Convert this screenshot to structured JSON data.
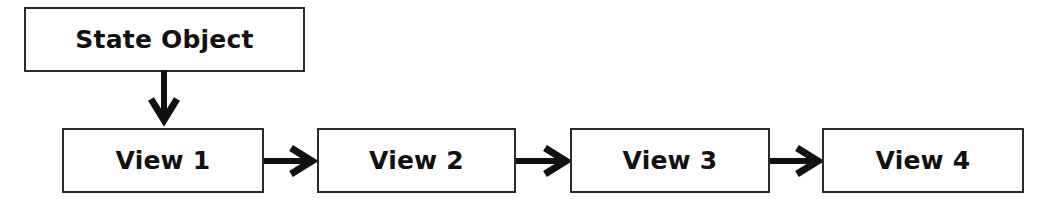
{
  "diagram": {
    "type": "flow-diagram",
    "background_color": "#ffffff",
    "stroke_color": "#2b2b2b",
    "text_color": "#111111",
    "source_node": {
      "id": "state-object",
      "label": "State Object"
    },
    "flow_nodes": [
      {
        "id": "view-1",
        "label": "View 1"
      },
      {
        "id": "view-2",
        "label": "View 2"
      },
      {
        "id": "view-3",
        "label": "View 3"
      },
      {
        "id": "view-4",
        "label": "View 4"
      }
    ],
    "connectors": [
      {
        "id": "arrow-state-object-to-view-1",
        "direction": "down",
        "from": "state-object",
        "to": "view-1"
      },
      {
        "id": "arrow-view-1-to-view-2",
        "direction": "right",
        "from": "view-1",
        "to": "view-2"
      },
      {
        "id": "arrow-view-2-to-view-3",
        "direction": "right",
        "from": "view-2",
        "to": "view-3"
      },
      {
        "id": "arrow-view-3-to-view-4",
        "direction": "right",
        "from": "view-3",
        "to": "view-4"
      }
    ]
  }
}
